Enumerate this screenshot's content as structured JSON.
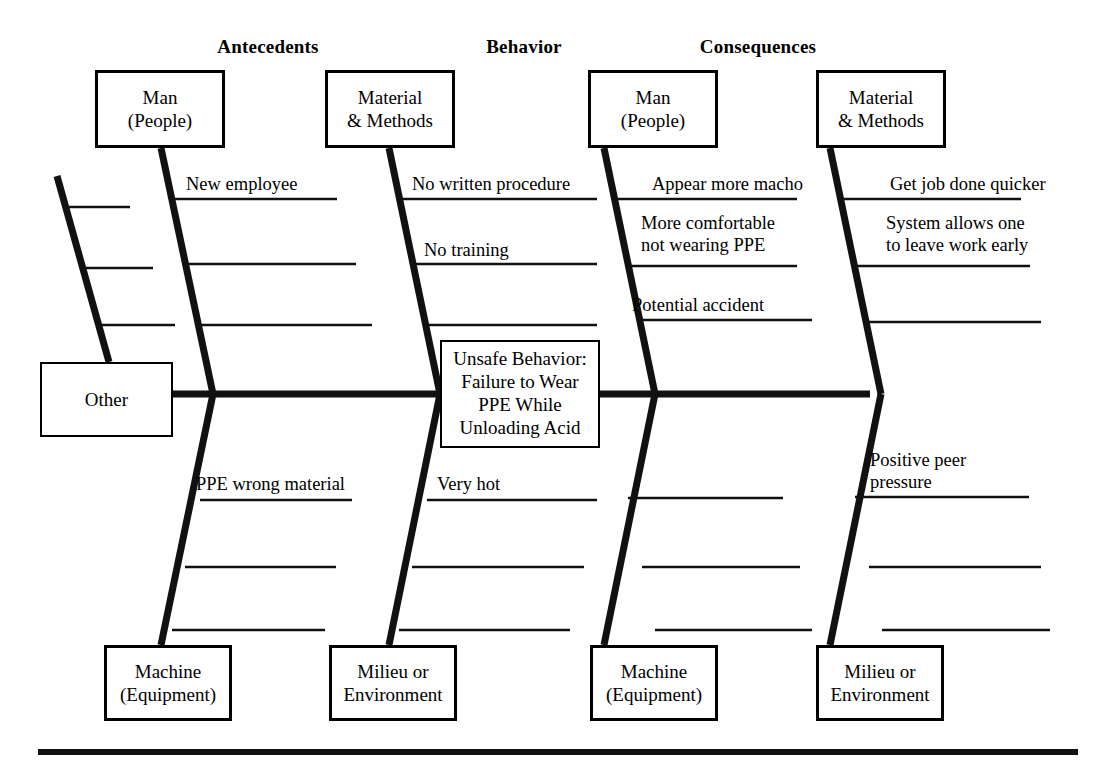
{
  "diagram": {
    "type": "fishbone-ishikawa",
    "column_headers": [
      {
        "label": "Antecedents",
        "x": 268,
        "y": 36
      },
      {
        "label": "Behavior",
        "x": 524,
        "y": 36
      },
      {
        "label": "Consequences",
        "x": 758,
        "y": 36
      }
    ],
    "effect": {
      "text": "Unsafe Behavior:\nFailure to Wear\nPPE While\nUnloading Acid"
    },
    "category_boxes": [
      {
        "name": "man-people-antecedents",
        "text": "Man\n(People)",
        "x": 95,
        "y": 70,
        "w": 130,
        "h": 78
      },
      {
        "name": "material-methods-antecedents",
        "text": "Material\n& Methods",
        "x": 325,
        "y": 70,
        "w": 130,
        "h": 78
      },
      {
        "name": "man-people-consequences",
        "text": "Man\n(People)",
        "x": 588,
        "y": 70,
        "w": 130,
        "h": 78
      },
      {
        "name": "material-methods-consequences",
        "text": "Material\n& Methods",
        "x": 816,
        "y": 70,
        "w": 130,
        "h": 78
      },
      {
        "name": "machine-equipment-antecedents",
        "text": "Machine\n(Equipment)",
        "x": 104,
        "y": 645,
        "w": 128,
        "h": 76
      },
      {
        "name": "milieu-environment-antecedents",
        "text": "Milieu or\nEnvironment",
        "x": 329,
        "y": 645,
        "w": 128,
        "h": 76
      },
      {
        "name": "machine-equipment-consequences",
        "text": "Machine\n(Equipment)",
        "x": 590,
        "y": 645,
        "w": 128,
        "h": 76
      },
      {
        "name": "milieu-environment-consequences",
        "text": "Milieu or\nEnvironment",
        "x": 816,
        "y": 645,
        "w": 128,
        "h": 76
      },
      {
        "name": "other",
        "text": "Other",
        "x": 40,
        "y": 362,
        "w": 133,
        "h": 75
      }
    ],
    "cause_labels": [
      {
        "name": "cause-new-employee",
        "text": "New employee",
        "x": 186,
        "y": 174
      },
      {
        "name": "cause-ppe-wrong-material",
        "text": "PPE wrong material",
        "x": 196,
        "y": 474
      },
      {
        "name": "cause-no-written-procedure",
        "text": "No written procedure",
        "x": 412,
        "y": 174
      },
      {
        "name": "cause-no-training",
        "text": "No training",
        "x": 424,
        "y": 240
      },
      {
        "name": "cause-very-hot",
        "text": "Very hot",
        "x": 437,
        "y": 474
      },
      {
        "name": "cause-appear-more-macho",
        "text": "Appear more macho",
        "x": 652,
        "y": 174
      },
      {
        "name": "cause-more-comfortable",
        "text": "More comfortable\nnot wearing PPE",
        "x": 641,
        "y": 213
      },
      {
        "name": "cause-potential-accident",
        "text": "Potential accident",
        "x": 632,
        "y": 295
      },
      {
        "name": "cause-get-job-done-quicker",
        "text": "Get job done quicker",
        "x": 890,
        "y": 174
      },
      {
        "name": "cause-system-allows",
        "text": "System allows one\nto leave work early",
        "x": 886,
        "y": 213
      },
      {
        "name": "cause-positive-peer",
        "text": "Positive peer\npressure",
        "x": 870,
        "y": 450
      }
    ]
  }
}
